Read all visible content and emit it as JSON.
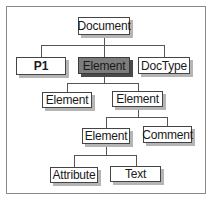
{
  "diagram": {
    "type": "tree",
    "title": "",
    "colors": {
      "node_fill": "#ffffff",
      "highlight_fill": "#7d7d7d",
      "border": "#444444",
      "shadow": "#b5b5b5",
      "frame": "#8a8a8a"
    },
    "nodes": {
      "document": {
        "label": "Document"
      },
      "p1": {
        "label": "P1"
      },
      "element_main": {
        "label": "Element",
        "highlighted": true
      },
      "doctype": {
        "label": "DocType"
      },
      "element_l2_left": {
        "label": "Element"
      },
      "element_l2_right": {
        "label": "Element"
      },
      "element_l3": {
        "label": "Element"
      },
      "comment": {
        "label": "Comment"
      },
      "attribute": {
        "label": "Attribute"
      },
      "text": {
        "label": "Text"
      }
    },
    "edges": [
      [
        "document",
        "p1"
      ],
      [
        "document",
        "element_main"
      ],
      [
        "document",
        "doctype"
      ],
      [
        "element_main",
        "element_l2_left"
      ],
      [
        "element_main",
        "element_l2_right"
      ],
      [
        "element_l2_right",
        "element_l3"
      ],
      [
        "element_l2_right",
        "comment"
      ],
      [
        "element_l3",
        "attribute"
      ],
      [
        "element_l3",
        "text"
      ]
    ]
  }
}
